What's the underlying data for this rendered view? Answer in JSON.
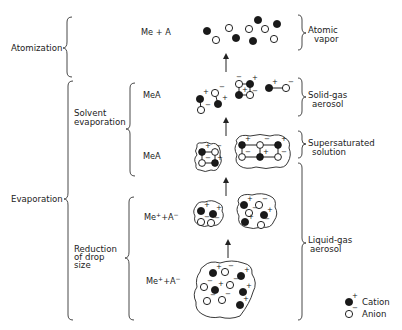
{
  "diagram": {
    "stages_left": {
      "atomization": "Atomization",
      "evaporation": "Evaporation",
      "solvent_evaporation": [
        "Solvent",
        "evaporation"
      ],
      "reduction_of_drop_size": [
        "Reduction",
        "of drop",
        "size"
      ]
    },
    "species": {
      "atomic": "Me + A",
      "solid": "MeA",
      "supersaturated": "MeA",
      "liquid_small": "Me",
      "liquid_large": "Me"
    },
    "species_parts": {
      "me": "Me",
      "plus_sup": "+",
      "plus_a": "+A",
      "minus_sup": "−"
    },
    "states_right": {
      "atomic_vapor": [
        "Atomic",
        "vapor"
      ],
      "solid_gas_aerosol": [
        "Solid-gas",
        "aerosol"
      ],
      "supersaturated_solution": [
        "Supersaturated",
        "solution"
      ],
      "liquid_gas_aerosol": [
        "Liquid-gas",
        "aerosol"
      ]
    },
    "legend": {
      "cation": "Cation",
      "anion": "Anion",
      "cation_symbol": "+",
      "anion_symbol": "−"
    },
    "charges": {
      "plus": "+",
      "minus": "−"
    },
    "colors": {
      "cation_fill": "#1a1a1a",
      "anion_fill": "#ffffff",
      "line": "#222222"
    }
  }
}
